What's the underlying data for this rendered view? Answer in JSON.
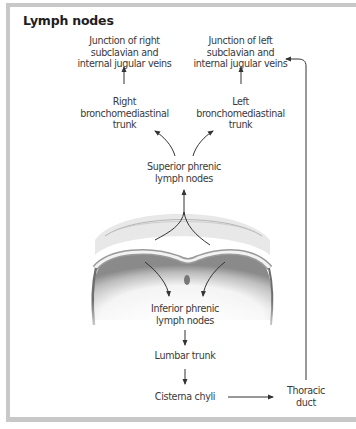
{
  "figure": {
    "title": "Lymph nodes",
    "nodes": {
      "junction_right": [
        "Junction of right",
        "subclavian and",
        "internal jugular veins"
      ],
      "junction_left": [
        "Junction of left",
        "subclavian and",
        "internal jugular veins"
      ],
      "right_trunk": [
        "Right",
        "bronchomediastinal",
        "trunk"
      ],
      "left_trunk": [
        "Left",
        "bronchomediastinal",
        "trunk"
      ],
      "superior_phrenic": [
        "Superior phrenic",
        "lymph nodes"
      ],
      "inferior_phrenic": [
        "Inferior phrenic",
        "lymph nodes"
      ],
      "lumbar_trunk": [
        "Lumbar trunk"
      ],
      "cisterna_chyli": [
        "Cisterna chyli"
      ],
      "thoracic_duct": [
        "Thoracic",
        "duct"
      ]
    },
    "illustration": "diaphragm-illustration",
    "colors": {
      "border": "#c8c8c8",
      "text": "#3a3a3a",
      "arrow": "#333333"
    }
  }
}
